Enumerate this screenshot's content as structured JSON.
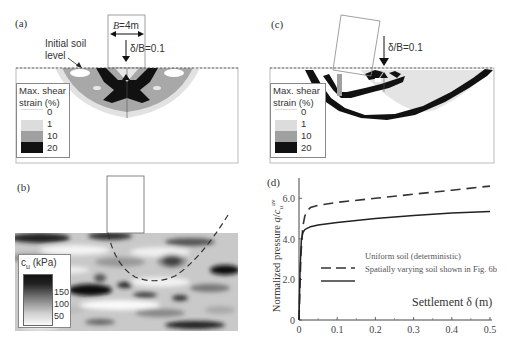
{
  "figure": {
    "panels": {
      "a": {
        "label": "(a)",
        "width_annotation": "B=4m",
        "settlement_annotation": "δ/B=0.1",
        "soil_level_annotation_line1": "Initial soil",
        "soil_level_annotation_line2": "level",
        "legend": {
          "title_line1": "Max. shear",
          "title_line2": "strain (%)",
          "entries": [
            {
              "value": "0",
              "color": "#ffffff"
            },
            {
              "value": "1",
              "color": "#dcdcdc"
            },
            {
              "value": "10",
              "color": "#a0a0a0"
            },
            {
              "value": "20",
              "color": "#111111"
            }
          ]
        }
      },
      "b": {
        "label": "(b)",
        "legend": {
          "title": "c",
          "title_sub": "u",
          "title_unit": " (kPa)",
          "ticks": [
            "150",
            "100",
            "50"
          ]
        }
      },
      "c": {
        "label": "(c)",
        "settlement_annotation": "δ/B=0.1",
        "legend": {
          "title_line1": "Max. shear",
          "title_line2": "strain (%)",
          "entries": [
            {
              "value": "0",
              "color": "#ffffff"
            },
            {
              "value": "1",
              "color": "#dcdcdc"
            },
            {
              "value": "10",
              "color": "#a0a0a0"
            },
            {
              "value": "20",
              "color": "#111111"
            }
          ]
        }
      },
      "d": {
        "label": "(d)"
      }
    }
  },
  "chart_data": {
    "type": "line",
    "title": "(d)",
    "xlabel": "Settlement δ (m)",
    "ylabel": "Normalized pressure q/c_u^av",
    "xlim": [
      0,
      0.5
    ],
    "ylim": [
      0,
      7.0
    ],
    "xticks": [
      "0",
      "0.1",
      "0.2",
      "0.3",
      "0.4",
      "0.5"
    ],
    "yticks": [
      "0",
      "2.0",
      "4.0",
      "6.0"
    ],
    "grid": false,
    "legend_position": "center-right",
    "series": [
      {
        "name": "Uniform soil (deterministic)",
        "style": "dashed",
        "x": [
          0,
          0.005,
          0.01,
          0.015,
          0.02,
          0.03,
          0.05,
          0.1,
          0.2,
          0.3,
          0.4,
          0.5
        ],
        "y": [
          0,
          3.2,
          4.6,
          5.1,
          5.35,
          5.55,
          5.65,
          5.8,
          6.0,
          6.2,
          6.4,
          6.6
        ]
      },
      {
        "name": "Spatially varying soil shown in Fig. 6b",
        "style": "solid",
        "x": [
          0,
          0.003,
          0.006,
          0.01,
          0.015,
          0.02,
          0.03,
          0.05,
          0.1,
          0.2,
          0.3,
          0.4,
          0.5
        ],
        "y": [
          0,
          2.5,
          3.9,
          4.3,
          4.45,
          4.5,
          4.6,
          4.68,
          4.8,
          5.0,
          5.15,
          5.28,
          5.35
        ]
      }
    ]
  }
}
